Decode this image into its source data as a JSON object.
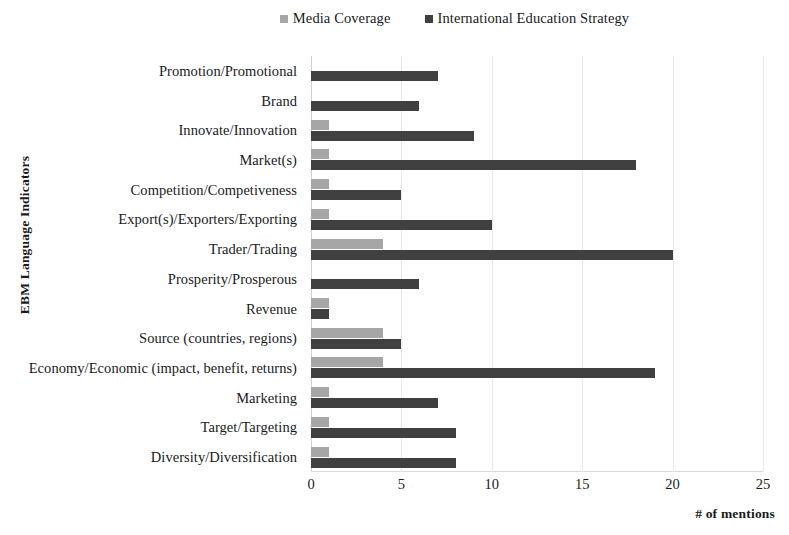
{
  "chart_data": {
    "type": "bar",
    "orientation": "horizontal",
    "title": "",
    "xlabel": "# of mentions",
    "ylabel": "EBM Language Indicators",
    "xlim": [
      0,
      25
    ],
    "xticks": [
      0,
      5,
      10,
      15,
      20,
      25
    ],
    "grid": true,
    "legend_position": "top-center",
    "colors": {
      "media_coverage": "#a6a6a6",
      "international_education_strategy": "#404040"
    },
    "categories": [
      "Promotion/Promotional",
      "Brand",
      "Innovate/Innovation",
      "Market(s)",
      "Competition/Competiveness",
      "Export(s)/Exporters/Exporting",
      "Trader/Trading",
      "Prosperity/Prosperous",
      "Revenue",
      "Source (countries, regions)",
      "Economy/Economic (impact, benefit, returns)",
      "Marketing",
      "Target/Targeting",
      "Diversity/Diversification"
    ],
    "series": [
      {
        "name": "Media Coverage",
        "color": "#a6a6a6",
        "values": [
          0,
          0,
          1,
          1,
          1,
          1,
          4,
          0,
          1,
          4,
          4,
          1,
          1,
          1
        ]
      },
      {
        "name": "International Education Strategy",
        "color": "#404040",
        "values": [
          7,
          6,
          9,
          18,
          5,
          10,
          20,
          6,
          1,
          5,
          19,
          7,
          8,
          8
        ]
      }
    ]
  },
  "legend": {
    "items": [
      {
        "label": "Media Coverage",
        "color": "#a6a6a6"
      },
      {
        "label": "International Education Strategy",
        "color": "#404040"
      }
    ]
  },
  "axes": {
    "x_title": "# of mentions",
    "y_title": "EBM Language Indicators",
    "x_tick_labels": [
      "0",
      "5",
      "10",
      "15",
      "20",
      "25"
    ]
  }
}
